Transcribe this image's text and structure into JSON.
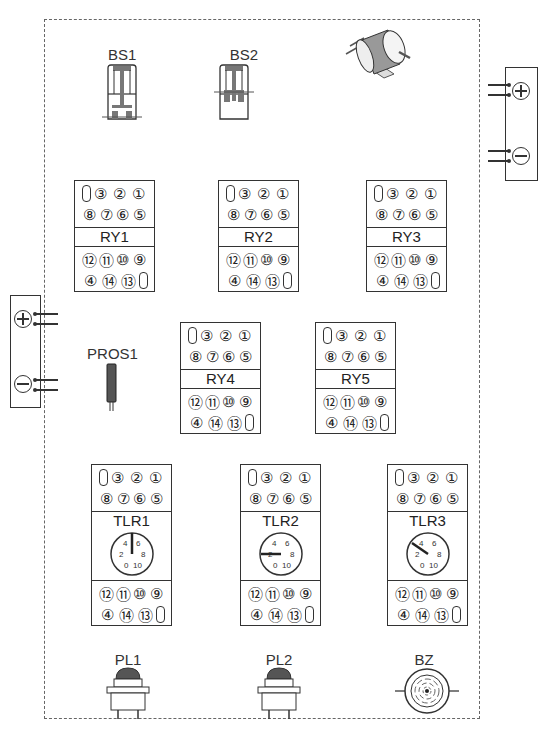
{
  "diagram": {
    "components": {
      "push_buttons": [
        {
          "label": "BS1"
        },
        {
          "label": "BS2"
        }
      ],
      "motor": {
        "label": ""
      },
      "power_supply_right": {
        "plus": "+",
        "minus": "−"
      },
      "power_supply_left": {
        "plus": "+",
        "minus": "−"
      },
      "relays": [
        {
          "label": "RY1"
        },
        {
          "label": "RY2"
        },
        {
          "label": "RY3"
        },
        {
          "label": "RY4"
        },
        {
          "label": "RY5"
        }
      ],
      "timers": [
        {
          "label": "TLR1",
          "dial_ticks": [
            "0",
            "2",
            "4",
            "6",
            "8",
            "10"
          ],
          "pointer_value": 5
        },
        {
          "label": "TLR2",
          "dial_ticks": [
            "0",
            "2",
            "4",
            "6",
            "8",
            "10"
          ],
          "pointer_value": 2
        },
        {
          "label": "TLR3",
          "dial_ticks": [
            "0",
            "2",
            "4",
            "6",
            "8",
            "10"
          ],
          "pointer_value": 3
        }
      ],
      "proximity_sensor": {
        "label": "PROS1"
      },
      "pilot_lamps": [
        {
          "label": "PL1"
        },
        {
          "label": "PL2"
        }
      ],
      "buzzer": {
        "label": "BZ"
      }
    },
    "pins": {
      "top_row1": [
        "③",
        "②",
        "①"
      ],
      "top_row2": [
        "⑧",
        "⑦",
        "⑥",
        "⑤"
      ],
      "bottom_row1": [
        "⑫",
        "⑪",
        "⑩",
        "⑨"
      ],
      "bottom_row2": [
        "④",
        "⑭",
        "⑬"
      ]
    }
  }
}
